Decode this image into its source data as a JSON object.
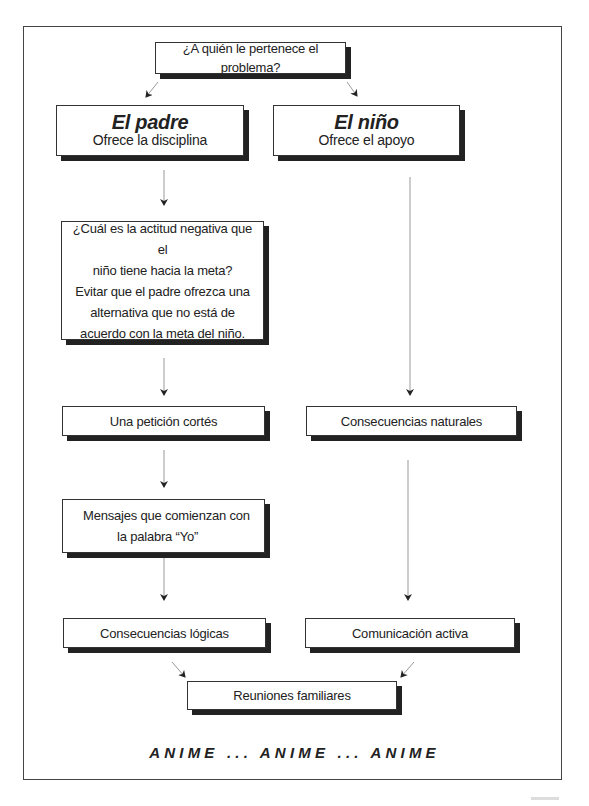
{
  "diagram": {
    "root": {
      "label": "¿A quién le pertenece el problema?"
    },
    "branches": [
      {
        "id": "padre",
        "title": "El padre",
        "subtitle": "Ofrece la disciplina",
        "steps": [
          "¿Cuál es la actitud negativa que el niño tiene hacia la meta? Evitar que el padre ofrezca una alternativa que no está de acuerdo con la meta del niño.",
          "Una petición cortés",
          "Mensajes que comienzan con la palabra “Yo”",
          "Consecuencias lógicas"
        ]
      },
      {
        "id": "nino",
        "title": "El niño",
        "subtitle": "Ofrece el apoyo",
        "steps": [
          "Consecuencias naturales",
          "Comunicación activa"
        ]
      }
    ],
    "merge": {
      "label": "Reuniones familiares"
    },
    "motto": "ANIME ... ANIME ... ANIME"
  },
  "box_texts": {
    "question_lines": [
      "¿Cuál es la actitud negativa que el",
      "niño tiene hacia la meta?",
      "Evitar que el padre ofrezca una",
      "alternativa que no está de",
      "acuerdo con la meta del niño."
    ],
    "mensajes_lines": [
      "Mensajes que comienzan con",
      "la palabra “Yo”"
    ]
  },
  "colors": {
    "border": "#333333",
    "shadow": "#222222",
    "arrow": "#999999",
    "arrowhead": "#222222"
  }
}
